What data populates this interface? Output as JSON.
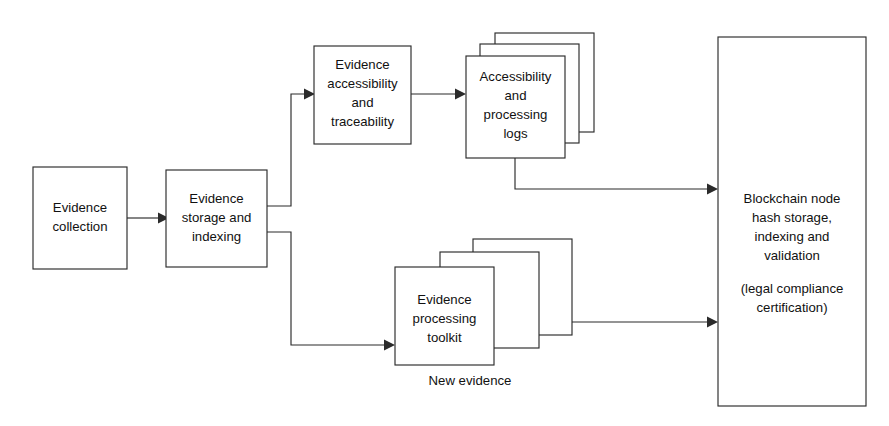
{
  "diagram": {
    "background_color": "#ffffff",
    "line_color": "#2b2b2b",
    "text_color": "#111111",
    "nodes": {
      "evidence_collection": {
        "lines": [
          "Evidence",
          "collection"
        ]
      },
      "evidence_storage": {
        "lines": [
          "Evidence",
          "storage and",
          "indexing"
        ]
      },
      "evidence_accessibility": {
        "lines": [
          "Evidence",
          "accessibility",
          "and",
          "traceability"
        ]
      },
      "accessibility_logs": {
        "lines": [
          "Accessibility",
          "and",
          "processing",
          "logs"
        ],
        "stack_count": 3
      },
      "evidence_toolkit": {
        "lines": [
          "Evidence",
          "processing",
          "toolkit"
        ],
        "stack_count": 3,
        "caption": "New evidence"
      },
      "blockchain_node": {
        "lines": [
          "Blockchain node",
          "hash storage,",
          "indexing and",
          "validation"
        ],
        "lines_secondary": [
          "(legal compliance",
          "certification)"
        ]
      }
    },
    "edges": [
      {
        "id": "collection-to-storage",
        "from": "evidence_collection",
        "to": "evidence_storage",
        "label": ""
      },
      {
        "id": "storage-to-accessibility",
        "from": "evidence_storage",
        "to": "evidence_accessibility",
        "label": ""
      },
      {
        "id": "accessibility-to-logs",
        "from": "evidence_accessibility",
        "to": "accessibility_logs",
        "label": ""
      },
      {
        "id": "logs-to-blockchain",
        "from": "accessibility_logs",
        "to": "blockchain_node",
        "label": ""
      },
      {
        "id": "storage-to-toolkit",
        "from": "evidence_storage",
        "to": "evidence_toolkit",
        "label": ""
      },
      {
        "id": "toolkit-to-blockchain",
        "from": "evidence_toolkit",
        "to": "blockchain_node",
        "label": ""
      }
    ]
  }
}
